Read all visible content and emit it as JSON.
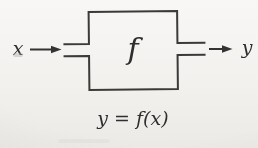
{
  "meta": {
    "paper_color": "#f2f1ee",
    "ink_color": "#3a3a3a"
  },
  "diagram": {
    "input_label": "x",
    "function_label": "f",
    "output_label": "y",
    "caption": "y = f(x)"
  }
}
